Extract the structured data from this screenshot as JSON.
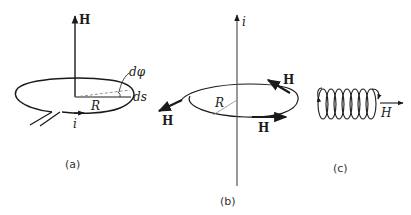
{
  "figure": {
    "panels": [
      {
        "id": "a",
        "caption": "(a)",
        "axis_label": "H",
        "labels": {
          "angle": "dφ",
          "arc": "ds",
          "radius": "R",
          "current": "i"
        }
      },
      {
        "id": "b",
        "caption": "(b)",
        "axis_label": "i",
        "labels": {
          "radius": "R",
          "field_left": "H",
          "field_right_top": "H",
          "field_right_bottom": "H"
        }
      },
      {
        "id": "c",
        "caption": "(c)",
        "labels": {
          "field": "H"
        }
      }
    ],
    "colors": {
      "ink": "#1a1a1a",
      "background": "#ffffff",
      "thin_line": "#888888"
    }
  }
}
